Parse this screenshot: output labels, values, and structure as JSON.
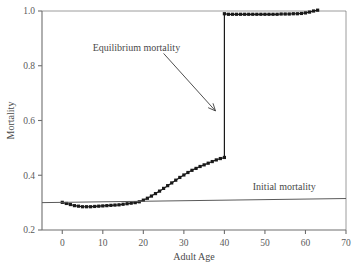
{
  "chart_data": {
    "type": "line",
    "title": "",
    "xlabel": "Adult Age",
    "ylabel": "Mortality",
    "xlim": [
      -5,
      70
    ],
    "ylim": [
      0.2,
      1.0
    ],
    "xticks": [
      0,
      10,
      20,
      30,
      40,
      50,
      60,
      70
    ],
    "xticklabels": [
      "0",
      "10",
      "20",
      "30",
      "40",
      "50",
      "60",
      "70"
    ],
    "yticks": [
      0.2,
      0.4,
      0.6,
      0.8,
      1.0
    ],
    "yticklabels": [
      "0.2",
      "0.4",
      "0.6",
      "0.8",
      "1.0"
    ],
    "grid": false,
    "legend": "none",
    "marker": "square",
    "series": [
      {
        "name": "Mortality",
        "marker": "filled-square",
        "color": "#1a1a1a",
        "x": [
          0,
          1,
          2,
          3,
          4,
          5,
          6,
          7,
          8,
          9,
          10,
          11,
          12,
          13,
          14,
          15,
          16,
          17,
          18,
          19,
          20,
          21,
          22,
          23,
          24,
          25,
          26,
          27,
          28,
          29,
          30,
          31,
          32,
          33,
          34,
          35,
          36,
          37,
          38,
          39,
          40,
          40,
          41,
          42,
          43,
          44,
          45,
          46,
          47,
          48,
          49,
          50,
          51,
          52,
          53,
          54,
          55,
          56,
          57,
          58,
          59,
          60,
          61,
          62,
          63
        ],
        "y": [
          0.301,
          0.297,
          0.293,
          0.289,
          0.287,
          0.285,
          0.285,
          0.285,
          0.286,
          0.287,
          0.288,
          0.289,
          0.29,
          0.291,
          0.292,
          0.294,
          0.296,
          0.298,
          0.3,
          0.303,
          0.309,
          0.316,
          0.324,
          0.333,
          0.342,
          0.352,
          0.362,
          0.372,
          0.382,
          0.392,
          0.401,
          0.41,
          0.418,
          0.425,
          0.432,
          0.438,
          0.444,
          0.45,
          0.456,
          0.461,
          0.465,
          0.99,
          0.988,
          0.988,
          0.988,
          0.988,
          0.988,
          0.988,
          0.988,
          0.988,
          0.988,
          0.988,
          0.988,
          0.988,
          0.988,
          0.989,
          0.989,
          0.989,
          0.99,
          0.99,
          0.991,
          0.993,
          0.996,
          1.0,
          1.003
        ]
      },
      {
        "name": "Initial mortality",
        "marker": "none",
        "color": "#5a5a5a",
        "x": [
          -5,
          70
        ],
        "y": [
          0.3,
          0.315
        ]
      }
    ],
    "annotations": [
      {
        "text": "Equilibrium mortality",
        "x_text": 7.5,
        "y_text": 0.855,
        "arrow_from_x": 25.0,
        "arrow_from_y": 0.845,
        "arrow_to_x": 37.8,
        "arrow_to_y": 0.635
      },
      {
        "text": "Initial mortality",
        "x_text": 47.0,
        "y_text": 0.345,
        "arrow_from_x": null,
        "arrow_from_y": null,
        "arrow_to_x": null,
        "arrow_to_y": null
      }
    ]
  },
  "figure": {
    "background": "#ffffff",
    "axis_color": "#6e6e6e",
    "data_color": "#1a1a1a",
    "text_color": "#4a4a4a"
  }
}
